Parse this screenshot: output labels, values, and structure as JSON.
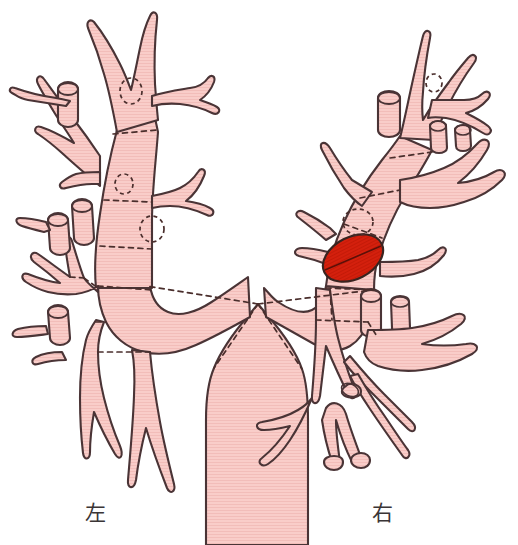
{
  "figure": {
    "type": "anatomical-diagram",
    "background_color": "#ffffff",
    "airway_fill_color": "#f8c9c6",
    "airway_stroke_color": "#4a3436",
    "lesion_fill_color": "#d4200d",
    "lesion_stroke_color": "#3a2420",
    "dashed_line_color": "#4a2e2c",
    "label_color": "#3a3536"
  },
  "labels": {
    "left": "左",
    "right": "右"
  },
  "lesion": {
    "name": "tumor",
    "shape": "ellipse",
    "center_x": 353,
    "center_y": 258,
    "radius_x": 32,
    "radius_y": 21,
    "rotation_deg": -27,
    "color": "#d4200d",
    "location": "right main bronchus / right upper lobe orifice"
  },
  "orifice_markers": [
    {
      "name": "left-upper-orifice-1",
      "cx": 131,
      "cy": 91,
      "rx": 11,
      "ry": 13,
      "rot": 0
    },
    {
      "name": "left-upper-orifice-2",
      "cx": 124,
      "cy": 184,
      "rx": 9,
      "ry": 10,
      "rot": 0
    },
    {
      "name": "left-upper-orifice-3",
      "cx": 152,
      "cy": 229,
      "rx": 12,
      "ry": 13,
      "rot": 0
    },
    {
      "name": "right-upper-orifice-1",
      "cx": 434,
      "cy": 83,
      "rx": 8,
      "ry": 9,
      "rot": 0
    },
    {
      "name": "right-upper-orifice-2",
      "cx": 358,
      "cy": 222,
      "rx": 15,
      "ry": 13,
      "rot": 0
    }
  ],
  "anatomy_regions": [
    {
      "name": "trachea",
      "side": "center"
    },
    {
      "name": "carina",
      "side": "center"
    },
    {
      "name": "left-main-bronchus",
      "side": "left"
    },
    {
      "name": "left-upper-lobe-bronchus",
      "side": "left"
    },
    {
      "name": "left-lower-lobe-bronchus",
      "side": "left"
    },
    {
      "name": "right-main-bronchus",
      "side": "right"
    },
    {
      "name": "right-upper-lobe-bronchus",
      "side": "right"
    },
    {
      "name": "right-middle-lobe-bronchus",
      "side": "right"
    },
    {
      "name": "right-lower-lobe-bronchus",
      "side": "right"
    }
  ]
}
